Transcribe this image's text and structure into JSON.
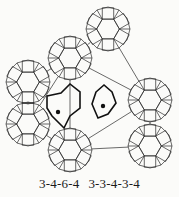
{
  "figure": {
    "line_color": "#2a2a2a",
    "bold_color": "#111111",
    "background": "#fbfbf9",
    "rosette_radius": 22,
    "rosettes": [
      {
        "cx": 108,
        "cy": 29
      },
      {
        "cx": 70,
        "cy": 58
      },
      {
        "cx": 28,
        "cy": 82
      },
      {
        "cx": 150,
        "cy": 100
      },
      {
        "cx": 28,
        "cy": 124
      },
      {
        "cx": 70,
        "cy": 150
      },
      {
        "cx": 150,
        "cy": 146
      }
    ],
    "highlighted": [
      {
        "type": "hexagon-with-square",
        "label_ref": "3-4-6-4",
        "dot": {
          "x": 58,
          "y": 112
        }
      },
      {
        "type": "pentagon",
        "label_ref": "3-3-4-3-4",
        "dot": {
          "x": 103,
          "y": 106
        }
      }
    ]
  },
  "caption": {
    "labels": [
      "3-4-6-4",
      "3-3-4-3-4"
    ]
  }
}
